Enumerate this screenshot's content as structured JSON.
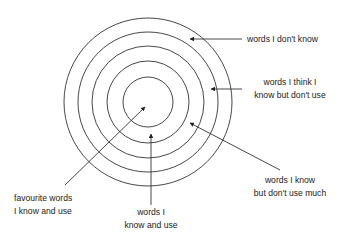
{
  "diagram": {
    "title": "",
    "stroke_color": "#333333",
    "circles": [
      {
        "id": "outer",
        "r": 84
      },
      {
        "id": "ring4",
        "r": 70
      },
      {
        "id": "ring3",
        "r": 56
      },
      {
        "id": "ring2",
        "r": 41
      },
      {
        "id": "inner",
        "r": 25
      }
    ],
    "labels": {
      "dont_know": {
        "lines": [
          "words I don't know"
        ]
      },
      "think_know": {
        "lines": [
          "words I think I",
          "know but don't use"
        ]
      },
      "know_not_much": {
        "lines": [
          "words I know",
          "but don't use much"
        ]
      },
      "favourite": {
        "lines": [
          "favourite words",
          "I know and use"
        ]
      },
      "know_use": {
        "lines": [
          "words I",
          "know and use"
        ]
      }
    }
  }
}
